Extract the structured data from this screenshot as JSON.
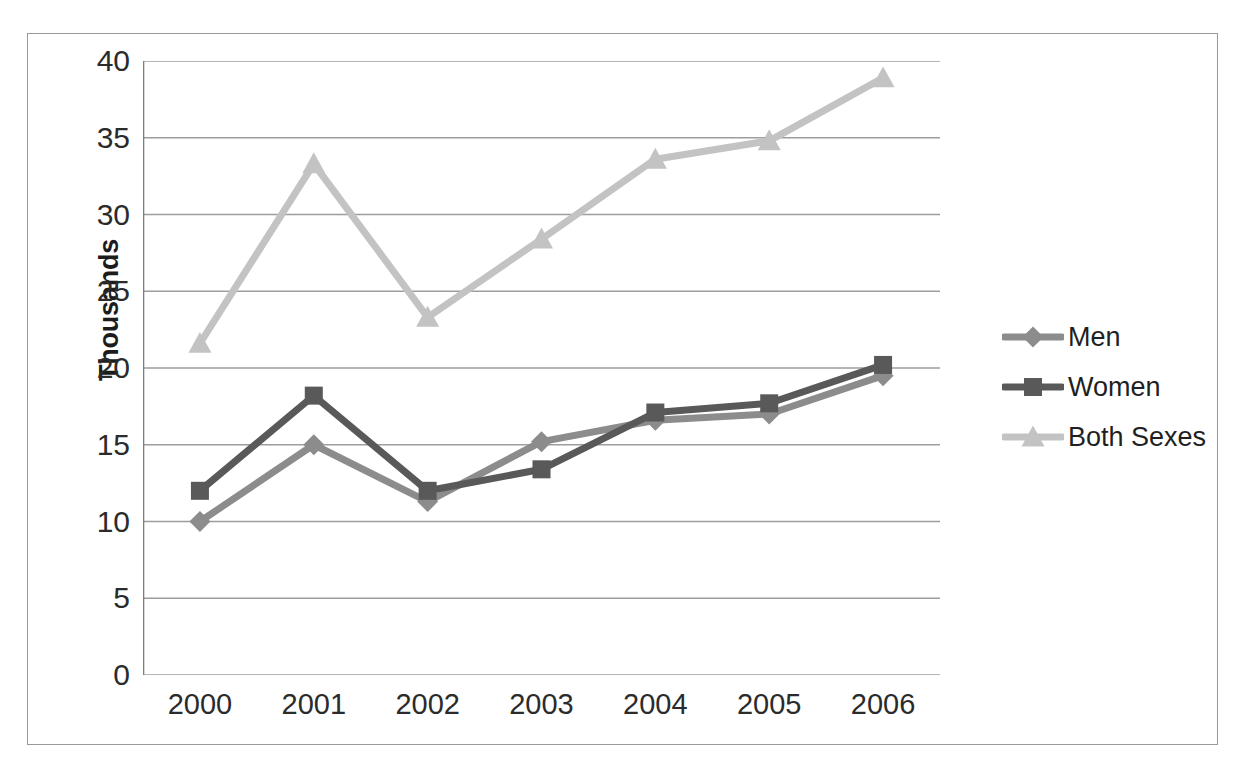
{
  "chart_data": {
    "type": "line",
    "title": "",
    "subtitle": "",
    "xlabel": "",
    "ylabel": "Thousands",
    "categories": [
      "2000",
      "2001",
      "2002",
      "2003",
      "2004",
      "2005",
      "2006"
    ],
    "series": [
      {
        "name": "Men",
        "color": "#8c8c8c",
        "marker": "diamond",
        "values": [
          10.0,
          15.0,
          11.3,
          15.2,
          16.6,
          17.0,
          19.5
        ]
      },
      {
        "name": "Women",
        "color": "#595959",
        "marker": "square",
        "values": [
          12.0,
          18.2,
          12.0,
          13.4,
          17.1,
          17.7,
          20.2
        ]
      },
      {
        "name": "Both Sexes",
        "color": "#c3c3c3",
        "marker": "triangle",
        "values": [
          21.6,
          33.3,
          23.3,
          28.4,
          33.6,
          34.8,
          38.9
        ]
      }
    ],
    "ylim": [
      0,
      40
    ],
    "y_ticks": [
      0,
      5,
      10,
      15,
      20,
      25,
      30,
      35,
      40
    ],
    "y_tick_labels": [
      "0",
      "5",
      "10",
      "15",
      "20",
      "25",
      "30",
      "35",
      "40"
    ],
    "grid": true,
    "grid_axis": "y",
    "legend_position": "right",
    "legend_entries": [
      "Men",
      "Women",
      "Both Sexes"
    ],
    "annotations": []
  },
  "axes": {
    "y_title": "Thousands",
    "y_tick_labels": [
      "40",
      "35",
      "30",
      "25",
      "20",
      "15",
      "10",
      "5",
      "0"
    ],
    "x_tick_labels": [
      "2000",
      "2001",
      "2002",
      "2003",
      "2004",
      "2005",
      "2006"
    ]
  },
  "legend": {
    "items": [
      {
        "label": "Men",
        "color": "#8c8c8c",
        "marker": "diamond"
      },
      {
        "label": "Women",
        "color": "#595959",
        "marker": "square"
      },
      {
        "label": "Both Sexes",
        "color": "#c3c3c3",
        "marker": "triangle"
      }
    ]
  },
  "style": {
    "grid_color": "#9d9d9d",
    "axis_color": "#7d7d7d",
    "frame_color": "#9a9a9a",
    "text_color": "#2b2b2b",
    "background": "#ffffff"
  }
}
